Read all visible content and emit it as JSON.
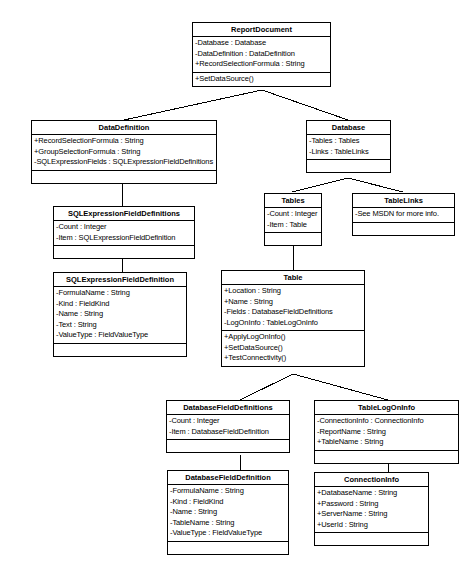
{
  "diagram": {
    "type": "uml-class-diagram",
    "stroke_color": "#000000",
    "fill_color": "#ffffff",
    "classes": [
      {
        "id": "report-document",
        "name": "ReportDocument",
        "attributes": [
          "-Database : Database",
          "-DataDefinition : DataDefinition",
          "+RecordSelectionFormula : String"
        ],
        "operations": [
          "+SetDataSource()"
        ]
      },
      {
        "id": "data-definition",
        "name": "DataDefinition",
        "attributes": [
          "+RecordSelectionFormula : String",
          "+GroupSelectionFormula : String",
          "-SQLExpressionFields : SQLExpressionFieldDefinitions"
        ],
        "operations": []
      },
      {
        "id": "database",
        "name": "Database",
        "attributes": [
          "-Tables : Tables",
          "-Links : TableLinks"
        ],
        "operations": []
      },
      {
        "id": "tables",
        "name": "Tables",
        "attributes": [
          "-Count : Integer",
          "-Item : Table"
        ],
        "operations": []
      },
      {
        "id": "table-links",
        "name": "TableLinks",
        "attributes": [
          "-See MSDN for more info."
        ],
        "operations": []
      },
      {
        "id": "sql-expression-field-definitions",
        "name": "SQLExpressionFieldDefinitions",
        "attributes": [
          "-Count : Integer",
          "-Item : SQLExpressionFieldDefinition"
        ],
        "operations": []
      },
      {
        "id": "sql-expression-field-definition",
        "name": "SQLExpressionFieldDefinition",
        "attributes": [
          "-FormulaName : String",
          "-Kind : FieldKind",
          "-Name : String",
          "-Text : String",
          "-ValueType : FieldValueType"
        ],
        "operations": []
      },
      {
        "id": "table",
        "name": "Table",
        "attributes": [
          "+Location : String",
          "+Name : String",
          "-Fields : DatabaseFieldDefinitions",
          "-LogOnInfo : TableLogOnInfo"
        ],
        "operations": [
          "+ApplyLogOnInfo()",
          "+SetDataSource()",
          "+TestConnectivity()"
        ]
      },
      {
        "id": "database-field-definitions",
        "name": "DatabaseFieldDefinitions",
        "attributes": [
          "-Count : Integer",
          "-Item : DatabaseFieldDefinition"
        ],
        "operations": []
      },
      {
        "id": "table-log-on-info",
        "name": "TableLogOnInfo",
        "attributes": [
          "-ConnectionInfo : ConnectionInfo",
          "-ReportName : String",
          "+TableName : String"
        ],
        "operations": []
      },
      {
        "id": "database-field-definition",
        "name": "DatabaseFieldDefinition",
        "attributes": [
          "-FormulaName : String",
          "-Kind : FieldKind",
          "-Name : String",
          "-TableName : String",
          "-ValueType : FieldValueType"
        ],
        "operations": []
      },
      {
        "id": "connection-info",
        "name": "ConnectionInfo",
        "attributes": [
          "+DatabaseName : String",
          "+Password : String",
          "+ServerName : String",
          "+UserId : String"
        ],
        "operations": []
      }
    ],
    "relationships": [
      {
        "from": "report-document",
        "to": "data-definition"
      },
      {
        "from": "report-document",
        "to": "database"
      },
      {
        "from": "data-definition",
        "to": "sql-expression-field-definitions"
      },
      {
        "from": "sql-expression-field-definitions",
        "to": "sql-expression-field-definition"
      },
      {
        "from": "database",
        "to": "tables"
      },
      {
        "from": "database",
        "to": "table-links"
      },
      {
        "from": "tables",
        "to": "table"
      },
      {
        "from": "table",
        "to": "database-field-definitions"
      },
      {
        "from": "table",
        "to": "table-log-on-info"
      },
      {
        "from": "database-field-definitions",
        "to": "database-field-definition"
      },
      {
        "from": "table-log-on-info",
        "to": "connection-info"
      }
    ]
  }
}
